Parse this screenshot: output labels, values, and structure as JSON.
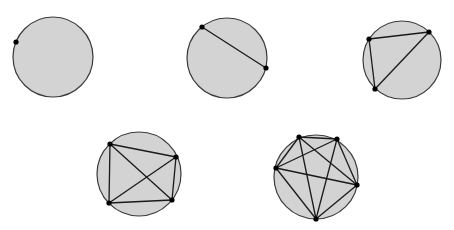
{
  "diagram": {
    "title": "",
    "style": {
      "circle_fill": "#d3d3d3",
      "circle_stroke": "#3a3a3a",
      "chord_stroke": "#1a1a1a",
      "point_fill": "#000000",
      "background": "#ffffff"
    },
    "figures": [
      {
        "id": "n1",
        "num_points": 1,
        "circle": {
          "cx": 53,
          "cy": 57,
          "r": 40
        },
        "points": [
          [
            16,
            42
          ]
        ]
      },
      {
        "id": "n2",
        "num_points": 2,
        "circle": {
          "cx": 227,
          "cy": 58,
          "r": 40
        },
        "points": [
          [
            202,
            27
          ],
          [
            266,
            68
          ]
        ]
      },
      {
        "id": "n3",
        "num_points": 3,
        "circle": {
          "cx": 402,
          "cy": 60,
          "r": 39
        },
        "points": [
          [
            369,
            39
          ],
          [
            429,
            32
          ],
          [
            375,
            89
          ]
        ]
      },
      {
        "id": "n4",
        "num_points": 4,
        "circle": {
          "cx": 139,
          "cy": 174,
          "r": 42
        },
        "points": [
          [
            110,
            144
          ],
          [
            176,
            157
          ],
          [
            172,
            200
          ],
          [
            109,
            203
          ]
        ]
      },
      {
        "id": "n5",
        "num_points": 5,
        "circle": {
          "cx": 316,
          "cy": 177,
          "r": 42
        },
        "points": [
          [
            299,
            137
          ],
          [
            337,
            139
          ],
          [
            357,
            185
          ],
          [
            316,
            219
          ],
          [
            276,
            168
          ]
        ]
      }
    ]
  }
}
